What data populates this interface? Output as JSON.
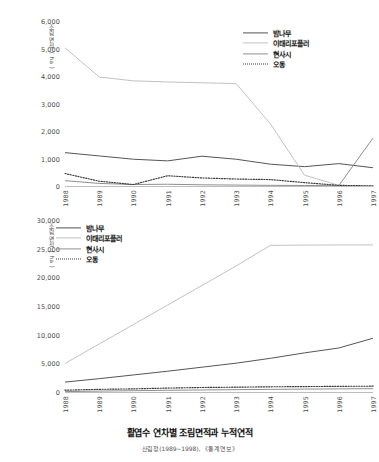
{
  "figure": {
    "title": "활엽수 연차별 조림면적과 누적연적",
    "source": "산림청(1989~1998), 《통계연보》"
  },
  "series_colors": {
    "밤나무": "#555555",
    "이태리포플러": "#c2c2c2",
    "현사시": "#8f8f8f",
    "오동": "#3a3a3a"
  },
  "legend": {
    "items": [
      {
        "label": "밤나무",
        "color": "#555555",
        "style": "solid"
      },
      {
        "label": "이태리포플러",
        "color": "#c2c2c2",
        "style": "solid"
      },
      {
        "label": "현사시",
        "color": "#8f8f8f",
        "style": "solid"
      },
      {
        "label": "오동",
        "color": "#3a3a3a",
        "style": "dotted"
      }
    ]
  },
  "chart_data": [
    {
      "id": "annual",
      "type": "line",
      "title": "",
      "xlabel": "",
      "ylabel": "조림면적 ( ha )",
      "x": [
        1988,
        1989,
        1990,
        1991,
        1992,
        1993,
        1994,
        1995,
        1996,
        1997
      ],
      "xtick_labels": [
        "1988",
        "1989",
        "1990",
        "1991",
        "1992",
        "1993",
        "1994",
        "1995",
        "1996",
        "1997"
      ],
      "ylim": [
        0,
        6000
      ],
      "yticks": [
        0,
        1000,
        2000,
        3000,
        4000,
        5000,
        6000
      ],
      "ytick_labels": [
        "0",
        "1,000",
        "2,000",
        "3,000",
        "4,000",
        "5,000",
        "6,000"
      ],
      "grid": false,
      "legend_position": "top-right",
      "series": [
        {
          "name": "밤나무",
          "color": "#555555",
          "style": "solid",
          "values": [
            1250,
            1130,
            1010,
            950,
            1120,
            1010,
            830,
            740,
            850,
            700
          ]
        },
        {
          "name": "이태리포플러",
          "color": "#c2c2c2",
          "style": "solid",
          "values": [
            5060,
            4000,
            3860,
            3820,
            3790,
            3760,
            2300,
            430,
            60,
            30
          ]
        },
        {
          "name": "현사시",
          "color": "#8f8f8f",
          "style": "solid",
          "values": [
            230,
            130,
            90,
            100,
            80,
            70,
            60,
            55,
            50,
            1780
          ]
        },
        {
          "name": "오동",
          "color": "#3a3a3a",
          "style": "dotted",
          "values": [
            490,
            210,
            90,
            410,
            330,
            290,
            270,
            160,
            60,
            40
          ]
        }
      ]
    },
    {
      "id": "cumulative",
      "type": "line",
      "title": "",
      "xlabel": "",
      "ylabel": "조림면적 ( ha )",
      "x": [
        1988,
        1989,
        1990,
        1991,
        1992,
        1993,
        1994,
        1995,
        1996,
        1997
      ],
      "xtick_labels": [
        "1988",
        "1989",
        "1990",
        "1991",
        "1992",
        "1993",
        "1994",
        "1995",
        "1996",
        "1997"
      ],
      "ylim": [
        0,
        30000
      ],
      "yticks": [
        0,
        5000,
        10000,
        15000,
        20000,
        25000,
        30000
      ],
      "ytick_labels": [
        "0",
        "5,000",
        "10,000",
        "15,000",
        "20,000",
        "25,000",
        "30,000"
      ],
      "grid": false,
      "legend_position": "top-left",
      "series": [
        {
          "name": "밤나무",
          "color": "#555555",
          "style": "solid",
          "values": [
            1900,
            2500,
            3150,
            3800,
            4500,
            5200,
            6050,
            7000,
            7850,
            9550
          ]
        },
        {
          "name": "이태리포플러",
          "color": "#c2c2c2",
          "style": "solid",
          "values": [
            5150,
            8550,
            11950,
            15350,
            18750,
            22150,
            25750,
            25800,
            25820,
            25830
          ]
        },
        {
          "name": "현사시",
          "color": "#8f8f8f",
          "style": "solid",
          "values": [
            240,
            330,
            400,
            470,
            530,
            580,
            630,
            680,
            720,
            760
          ]
        },
        {
          "name": "오동",
          "color": "#3a3a3a",
          "style": "dotted",
          "values": [
            490,
            640,
            720,
            860,
            960,
            1020,
            1080,
            1120,
            1160,
            1190
          ]
        }
      ]
    }
  ]
}
